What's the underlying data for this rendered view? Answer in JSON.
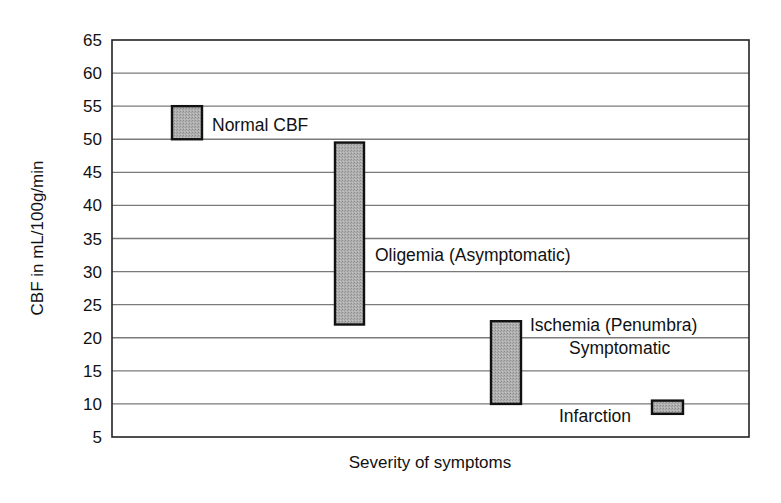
{
  "chart_data": {
    "type": "floating-bar",
    "title": "",
    "xlabel": "Severity of symptoms",
    "ylabel": "CBF in mL/100g/min",
    "ylim": [
      5,
      65
    ],
    "yticks": [
      5,
      10,
      15,
      20,
      25,
      30,
      35,
      40,
      45,
      50,
      55,
      60,
      65
    ],
    "grid": true,
    "legend": "none",
    "categories": [
      "Normal CBF",
      "Oligemia (Asymptomatic)",
      "Ischemia (Penumbra) Symptomatic",
      "Infarction"
    ],
    "series": [
      {
        "name": "CBF range",
        "ranges": [
          {
            "label": "Normal CBF",
            "low": 50,
            "high": 55
          },
          {
            "label": "Oligemia (Asymptomatic)",
            "low": 22,
            "high": 49.5
          },
          {
            "label": "Ischemia (Penumbra) Symptomatic",
            "low": 10,
            "high": 22.5
          },
          {
            "label": "Infarction",
            "low": 8.5,
            "high": 10.5
          }
        ]
      }
    ]
  },
  "labels": {
    "normal": "Normal CBF",
    "oligemia": "Oligemia (Asymptomatic)",
    "ischemia_line1": "Ischemia (Penumbra)",
    "ischemia_line2": "Symptomatic",
    "infarction": "Infarction"
  },
  "colors": {
    "bar_fill": "#a9a9a9",
    "bar_stroke": "#111111",
    "grid": "#7a7a7a",
    "axis": "#222222"
  }
}
